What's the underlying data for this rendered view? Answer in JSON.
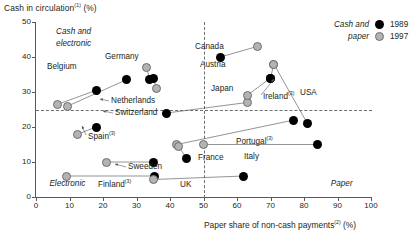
{
  "chart_data": {
    "type": "scatter",
    "title": "Cash in circulation(1) (%)",
    "ylabel": "Cash in circulation",
    "ylabel_sup": "(1)",
    "ylabel_unit": "(%)",
    "xlabel": "Paper share of non-cash payments",
    "xlabel_sup": "(2)",
    "xlabel_unit": "(%)",
    "xlim": [
      0,
      100
    ],
    "ylim": [
      0,
      50
    ],
    "xticks": [
      0,
      10,
      20,
      30,
      40,
      50,
      60,
      70,
      80,
      90,
      100
    ],
    "yticks": [
      0,
      10,
      20,
      30,
      40,
      50
    ],
    "grid": false,
    "reference_lines": {
      "horizontal": 25,
      "vertical": 50
    },
    "quadrant_labels": [
      {
        "text": "Cash and",
        "x": 6,
        "y": 47
      },
      {
        "text": "electronic",
        "x": 6,
        "y": 43.5
      },
      {
        "text": "Electronic",
        "x": 4,
        "y": 3.5
      },
      {
        "text": "Paper",
        "x": 88,
        "y": 3.5
      }
    ],
    "legend": {
      "title_line1": "Cash and",
      "title_line2": "paper",
      "position": "top-right",
      "entries": [
        {
          "label": "1989",
          "color": "#000000"
        },
        {
          "label": "1997",
          "color": "#b3b3b3"
        }
      ]
    },
    "series": [
      {
        "name": "1989",
        "color": "#000000"
      },
      {
        "name": "1997",
        "color": "#b3b3b3"
      }
    ],
    "countries": [
      {
        "name": "Belgium",
        "sup": "",
        "v1989": {
          "x": 18.0,
          "y": 30.5
        },
        "v1997": {
          "x": 6.5,
          "y": 26.5
        }
      },
      {
        "name": "Netherlands",
        "sup": "",
        "v1989": {
          "x": 27.0,
          "y": 33.5
        },
        "v1997": {
          "x": 9.5,
          "y": 26.0
        }
      },
      {
        "name": "Germany",
        "sup": "",
        "v1989": {
          "x": 34.0,
          "y": 33.5
        },
        "v1997": {
          "x": 33.0,
          "y": 37.0
        }
      },
      {
        "name": "Switzerland",
        "sup": "",
        "v1989": {
          "x": 35.0,
          "y": 34.0
        },
        "v1997": {
          "x": 36.0,
          "y": 31.0
        }
      },
      {
        "name": "Spain",
        "sup": "(3)",
        "v1989": {
          "x": 18.0,
          "y": 20.0
        },
        "v1997": {
          "x": 12.5,
          "y": 18.0
        }
      },
      {
        "name": "Sweeden",
        "sup": "",
        "v1989": {
          "x": 35.0,
          "y": 10.0
        },
        "v1997": {
          "x": 21.0,
          "y": 10.0
        }
      },
      {
        "name": "Finland",
        "sup": "(3)",
        "v1989": {
          "x": 35.5,
          "y": 6.0
        },
        "v1997": {
          "x": 9.0,
          "y": 6.0
        }
      },
      {
        "name": "Canada",
        "sup": "",
        "v1989": {
          "x": 55.0,
          "y": 40.0
        },
        "v1997": {
          "x": 66.0,
          "y": 43.0
        }
      },
      {
        "name": "Austria",
        "sup": "",
        "v1989": {
          "x": 70.0,
          "y": 34.0
        },
        "v1997": {
          "x": 71.0,
          "y": 38.0
        }
      },
      {
        "name": "Japan",
        "sup": "",
        "v1989": {
          "x": 39.0,
          "y": 24.0
        },
        "v1997": {
          "x": 63.0,
          "y": 27.0
        }
      },
      {
        "name": "Ireland",
        "sup": "(3)",
        "v1989": {
          "x": 70.0,
          "y": 34.0
        },
        "v1997": {
          "x": 63.0,
          "y": 29.0
        }
      },
      {
        "name": "USA",
        "sup": "",
        "v1989": {
          "x": 81.0,
          "y": 21.0
        },
        "v1997": {
          "x": 71.0,
          "y": 38.0
        }
      },
      {
        "name": "Portugal",
        "sup": "(3)",
        "v1989": {
          "x": 77.0,
          "y": 22.0
        },
        "v1997": {
          "x": 42.0,
          "y": 15.0
        }
      },
      {
        "name": "Italy",
        "sup": "",
        "v1989": {
          "x": 84.0,
          "y": 15.0
        },
        "v1997": {
          "x": 50.0,
          "y": 15.0
        }
      },
      {
        "name": "France",
        "sup": "",
        "v1989": {
          "x": 45.0,
          "y": 11.0
        },
        "v1997": {
          "x": 42.5,
          "y": 14.5
        }
      },
      {
        "name": "UK",
        "sup": "",
        "v1989": {
          "x": 62.0,
          "y": 6.0
        },
        "v1997": {
          "x": 35.0,
          "y": 5.0
        }
      }
    ]
  }
}
